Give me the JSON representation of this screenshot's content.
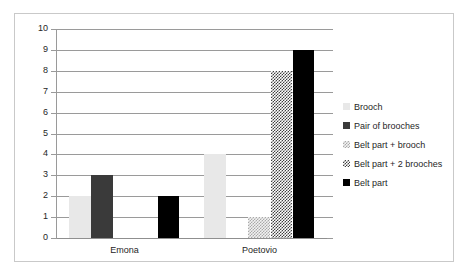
{
  "chart_data": {
    "type": "bar",
    "title": "",
    "subtitle": "",
    "xlabel": "",
    "ylabel": "",
    "categories": [
      "Emona",
      "Poetovio"
    ],
    "series": [
      {
        "name": "Brooch",
        "values": [
          2,
          4
        ],
        "color": "#E8E8E8",
        "pattern": "solid-light"
      },
      {
        "name": "Pair of brooches",
        "values": [
          3,
          0
        ],
        "color": "#3A3A3A",
        "pattern": "solid-dark"
      },
      {
        "name": "Belt part + brooch",
        "values": [
          0,
          1
        ],
        "color": "#A9A9A9",
        "pattern": "fine-dotted"
      },
      {
        "name": "Belt part + 2 brooches",
        "values": [
          0,
          8
        ],
        "color": "#404040",
        "pattern": "diagonal-hatch"
      },
      {
        "name": "Belt part",
        "values": [
          2,
          9
        ],
        "color": "#000000",
        "pattern": "solid-black"
      }
    ],
    "ylim": [
      0,
      10
    ],
    "yticks": [
      0,
      1,
      2,
      3,
      4,
      5,
      6,
      7,
      8,
      9,
      10
    ],
    "ytick_labels": [
      "0",
      "1",
      "2",
      "3",
      "4",
      "5",
      "6",
      "7",
      "8",
      "9",
      "10"
    ],
    "grid": true,
    "grid_axis": "y",
    "legend_position": "right",
    "frame_color": "#C9C9C9",
    "gridline_color": "#9A9A9A",
    "axis_color": "#9A9A9A",
    "background": "#FFFFFF"
  }
}
